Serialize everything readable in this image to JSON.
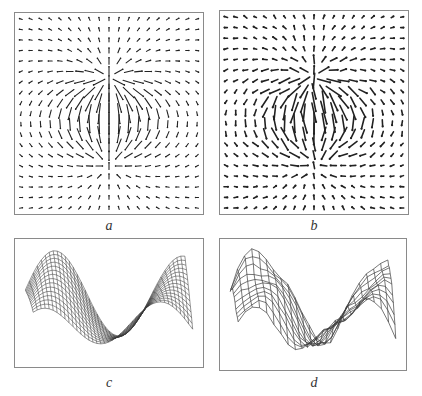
{
  "figure": {
    "panels": [
      {
        "id": "a",
        "caption": "a",
        "kind": "vector-field",
        "grid": 19,
        "density": "regular"
      },
      {
        "id": "b",
        "caption": "b",
        "kind": "vector-field",
        "grid": 19,
        "density": "noisy"
      },
      {
        "id": "c",
        "caption": "c",
        "kind": "mesh-surface",
        "smooth": true
      },
      {
        "id": "d",
        "caption": "d",
        "kind": "mesh-surface",
        "smooth": false
      }
    ]
  },
  "colors": {
    "border": "#8a8a8a",
    "arrow": "#222222",
    "mesh": "#3a3a3a",
    "background": "#ffffff"
  }
}
